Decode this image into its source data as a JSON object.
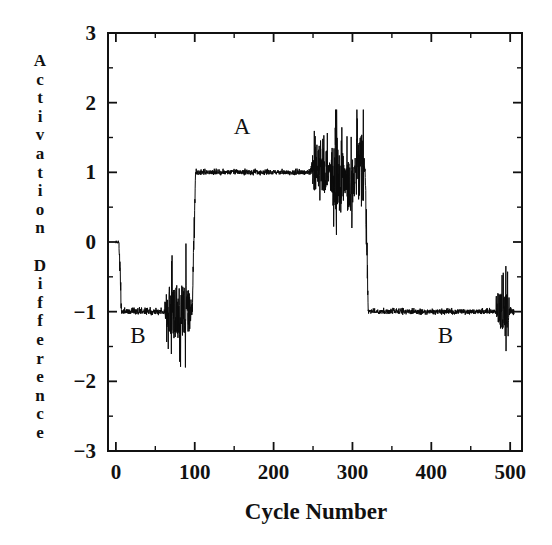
{
  "figure": {
    "background": "#ffffff",
    "ink_color": "#111111",
    "trace_color": "#0a0a0a"
  },
  "annotations": [
    {
      "text": "A",
      "x": 160,
      "y": 1.55,
      "name": "annotation-a"
    },
    {
      "text": "B",
      "x": 28,
      "y": -1.45,
      "name": "annotation-b-left"
    },
    {
      "text": "B",
      "x": 418,
      "y": -1.45,
      "name": "annotation-b-right"
    }
  ],
  "ylabel_letters": [
    "A",
    "c",
    "t",
    "i",
    "v",
    "a",
    "t",
    "i",
    "o",
    "n",
    "",
    "D",
    "i",
    "f",
    "f",
    "e",
    "r",
    "e",
    "n",
    "c",
    "e"
  ],
  "chart_data": {
    "type": "line",
    "title": "",
    "xlabel": "Cycle Number",
    "ylabel": "Activation Difference",
    "xlim": [
      -10,
      515
    ],
    "ylim": [
      -3,
      3
    ],
    "xticks": [
      0,
      100,
      200,
      300,
      400,
      500
    ],
    "xticklabels": [
      "0",
      "100",
      "200",
      "300",
      "400",
      "500"
    ],
    "xminor_step": 50,
    "yticks": [
      3,
      2,
      1,
      0,
      -1,
      -2,
      -3
    ],
    "yticklabels": [
      "3",
      "2",
      "1",
      "0",
      "−1",
      "−2",
      "−3"
    ],
    "grid": false,
    "legend": false,
    "series": [
      {
        "name": "Activation Difference",
        "description": "Single noisy trace starting at 0, settling to -1 (state B), jumping to +1 (state A) near cycle 100, returning to -1 near cycle 318, with turbulent bursts at the state transitions.",
        "segments": [
          {
            "from": 0,
            "to": 4,
            "level": 0.0,
            "noise": 0.02,
            "spike": 0.0,
            "note": "initial-zero"
          },
          {
            "from": 4,
            "to": 7,
            "level": -0.5,
            "noise": 0.55,
            "spike": 0.5,
            "note": "drop-to-B"
          },
          {
            "from": 7,
            "to": 62,
            "level": -1.0,
            "noise": 0.035,
            "spike": 0.06,
            "note": "flat-B-first"
          },
          {
            "from": 62,
            "to": 97,
            "level": -1.0,
            "noise": 0.38,
            "spike": 0.95,
            "note": "turbulent-B-end"
          },
          {
            "from": 97,
            "to": 101,
            "level": 0.0,
            "noise": 0.6,
            "spike": 0.6,
            "note": "transition-B-to-A"
          },
          {
            "from": 101,
            "to": 247,
            "level": 1.0,
            "noise": 0.03,
            "spike": 0.05,
            "note": "flat-A"
          },
          {
            "from": 247,
            "to": 272,
            "level": 1.05,
            "noise": 0.32,
            "spike": 0.55,
            "note": "turbulent-A-1"
          },
          {
            "from": 272,
            "to": 290,
            "level": 0.95,
            "noise": 0.55,
            "spike": 1.05,
            "note": "turbulent-A-2"
          },
          {
            "from": 290,
            "to": 303,
            "level": 0.8,
            "noise": 0.4,
            "spike": 0.75,
            "note": "turbulent-A-3"
          },
          {
            "from": 303,
            "to": 316,
            "level": 1.05,
            "noise": 0.5,
            "spike": 0.95,
            "note": "turbulent-A-4"
          },
          {
            "from": 316,
            "to": 320,
            "level": 0.0,
            "noise": 0.55,
            "spike": 0.6,
            "note": "transition-A-to-B"
          },
          {
            "from": 320,
            "to": 482,
            "level": -1.0,
            "noise": 0.03,
            "spike": 0.05,
            "note": "flat-B-second"
          },
          {
            "from": 482,
            "to": 499,
            "level": -1.0,
            "noise": 0.26,
            "spike": 0.7,
            "note": "burst-near-end"
          },
          {
            "from": 499,
            "to": 505,
            "level": -1.0,
            "noise": 0.05,
            "spike": 0.1,
            "note": "tail"
          }
        ],
        "extrema": {
          "ymax": 1.9,
          "ymin": -1.92
        }
      }
    ]
  }
}
